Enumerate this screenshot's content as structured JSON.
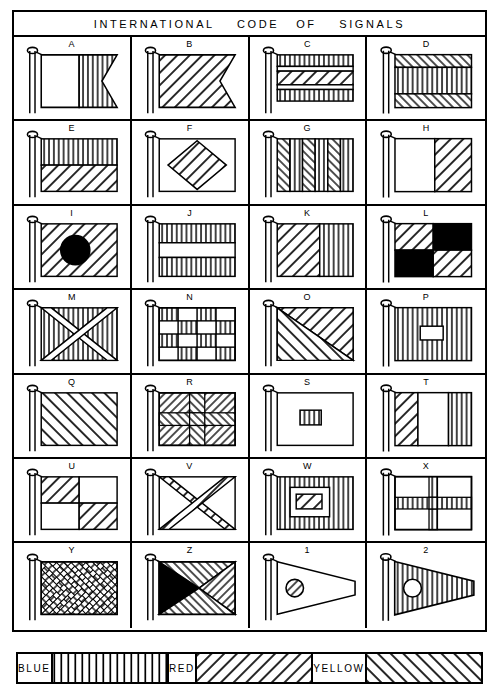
{
  "header": {
    "title": "INTERNATIONAL    CODE   OF    SIGNALS"
  },
  "chart_data": {
    "type": "table",
    "title": "INTERNATIONAL CODE OF SIGNALS",
    "columns": 4,
    "rows": 7,
    "legend_position": "bottom",
    "hatch_key": {
      "blue": "vertical-lines",
      "red": "diagonal-forward-slash",
      "yellow": "diagonal-back-slash",
      "white": "plain",
      "black": "solid-fill"
    },
    "cells": [
      {
        "label": "A",
        "shape": "swallowtail",
        "desc": "white hoist, blue fly swallowtail"
      },
      {
        "label": "B",
        "shape": "swallowtail",
        "desc": "all red swallowtail"
      },
      {
        "label": "C",
        "shape": "rectangle",
        "desc": "blue-white-red-white-blue horizontal bands"
      },
      {
        "label": "D",
        "shape": "rectangle",
        "desc": "yellow-blue-yellow horizontal bands"
      },
      {
        "label": "E",
        "shape": "rectangle",
        "desc": "blue over red horizontal halves"
      },
      {
        "label": "F",
        "shape": "rectangle",
        "desc": "white with red diamond"
      },
      {
        "label": "G",
        "shape": "rectangle",
        "desc": "six vertical stripes yellow and blue"
      },
      {
        "label": "H",
        "shape": "rectangle",
        "desc": "white hoist, red fly vertical halves"
      },
      {
        "label": "I",
        "shape": "rectangle",
        "desc": "yellow with black circle"
      },
      {
        "label": "J",
        "shape": "rectangle",
        "desc": "blue-white-blue horizontal bands"
      },
      {
        "label": "K",
        "shape": "rectangle",
        "desc": "yellow hoist, blue fly vertical halves"
      },
      {
        "label": "L",
        "shape": "rectangle",
        "desc": "yellow and black quartered"
      },
      {
        "label": "M",
        "shape": "rectangle",
        "desc": "blue with white saltire"
      },
      {
        "label": "N",
        "shape": "rectangle",
        "desc": "blue and white checkerboard 4x4"
      },
      {
        "label": "O",
        "shape": "rectangle",
        "desc": "red and yellow diagonal halves"
      },
      {
        "label": "P",
        "shape": "rectangle",
        "desc": "blue with white centre rectangle"
      },
      {
        "label": "Q",
        "shape": "rectangle",
        "desc": "all yellow"
      },
      {
        "label": "R",
        "shape": "rectangle",
        "desc": "red with yellow cross"
      },
      {
        "label": "S",
        "shape": "rectangle",
        "desc": "white with blue centre rectangle"
      },
      {
        "label": "T",
        "shape": "rectangle",
        "desc": "red, white, blue vertical bands"
      },
      {
        "label": "U",
        "shape": "rectangle",
        "desc": "red and white quartered"
      },
      {
        "label": "V",
        "shape": "rectangle",
        "desc": "white with red saltire"
      },
      {
        "label": "W",
        "shape": "rectangle",
        "desc": "blue border, white field, red centre"
      },
      {
        "label": "X",
        "shape": "rectangle",
        "desc": "white with blue cross"
      },
      {
        "label": "Y",
        "shape": "rectangle",
        "desc": "yellow and red diagonal stripes"
      },
      {
        "label": "Z",
        "shape": "rectangle",
        "desc": "black, yellow, blue, red triangles from hoist"
      },
      {
        "label": "1",
        "shape": "pennant",
        "desc": "white pennant with red circle"
      },
      {
        "label": "2",
        "shape": "pennant",
        "desc": "blue pennant with white circle"
      }
    ]
  },
  "legend": {
    "items": [
      {
        "label": "BLUE",
        "pattern": "vertical-lines"
      },
      {
        "label": "RED",
        "pattern": "diagonal-forward-slash"
      },
      {
        "label": "YELLOW",
        "pattern": "diagonal-back-slash"
      }
    ]
  }
}
